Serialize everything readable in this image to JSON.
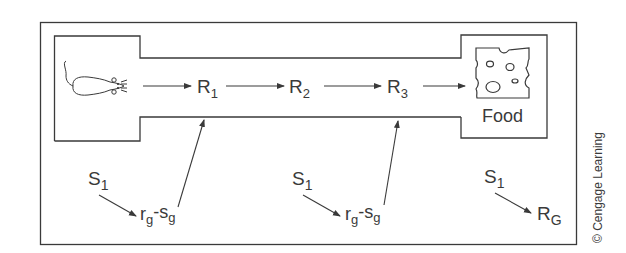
{
  "diagram": {
    "chain_labels": {
      "r1": {
        "base": "R",
        "sub": "1"
      },
      "r2": {
        "base": "R",
        "sub": "2"
      },
      "r3": {
        "base": "R",
        "sub": "3"
      }
    },
    "goal_label": "Food",
    "stimuli": [
      {
        "s": {
          "base": "S",
          "sub": "1"
        },
        "target": {
          "r": "r",
          "rsub": "g",
          "dash": "-",
          "s": "s",
          "ssub": "g"
        }
      },
      {
        "s": {
          "base": "S",
          "sub": "1"
        },
        "target": {
          "r": "r",
          "rsub": "g",
          "dash": "-",
          "s": "s",
          "ssub": "g"
        }
      },
      {
        "s": {
          "base": "S",
          "sub": "1"
        },
        "target": {
          "base": "R",
          "sub": "G"
        }
      }
    ],
    "credit": "© Cengage Learning",
    "icons": {
      "start": "mouse-icon",
      "goal": "cheese-icon"
    },
    "colors": {
      "stroke": "#3a3a3a",
      "background": "#ffffff"
    }
  }
}
